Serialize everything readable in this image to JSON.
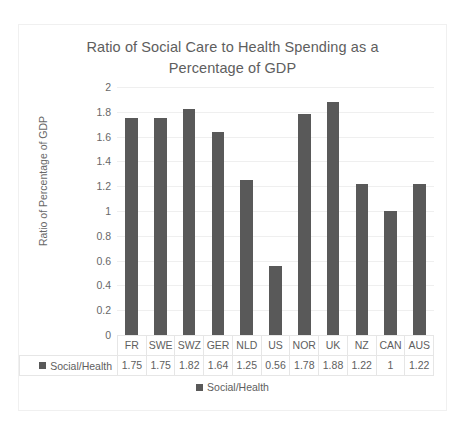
{
  "chart_data": {
    "type": "bar",
    "title": "Ratio of Social Care to Health Spending as a Percentage of GDP",
    "xlabel": "",
    "ylabel": "Ratio of Percentage of GDP",
    "ylim": [
      0,
      2
    ],
    "ytick_step": 0.2,
    "grid": true,
    "legend_position": "bottom",
    "bar_color": "#595959",
    "gridline_color": "#efefef",
    "text_color": "#5e5e5e",
    "categories": [
      "FR",
      "SWE",
      "SWZ",
      "GER",
      "NLD",
      "US",
      "NOR",
      "UK",
      "NZ",
      "CAN",
      "AUS"
    ],
    "yticks": [
      "2",
      "1.8",
      "1.6",
      "1.4",
      "1.2",
      "1",
      "0.8",
      "0.6",
      "0.4",
      "0.2",
      "0"
    ],
    "series": [
      {
        "name": "Social/Health",
        "values": [
          1.75,
          1.75,
          1.82,
          1.64,
          1.25,
          0.56,
          1.78,
          1.88,
          1.22,
          1,
          1.22
        ],
        "value_labels": [
          "1.75",
          "1.75",
          "1.82",
          "1.64",
          "1.25",
          "0.56",
          "1.78",
          "1.88",
          "1.22",
          "1",
          "1.22"
        ]
      }
    ]
  },
  "legend": {
    "entries": [
      {
        "label": "Social/Health",
        "color": "#595959"
      }
    ]
  },
  "data_table": {
    "row_label": "Social/Health"
  }
}
